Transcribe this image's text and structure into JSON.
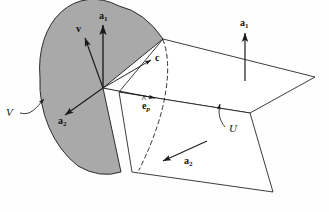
{
  "figure": {
    "kind": "vector-field-diagram",
    "caption": "",
    "colors": {
      "region_fill": "#a9a9a9",
      "stroke": "#1a1a1a",
      "background": "#fefefe",
      "dashed": "#1a1a1a"
    },
    "labels": {
      "region_v": "V",
      "vector_v": "v",
      "vector_a1_region": "a",
      "vector_a1_region_sub": "1",
      "vector_a2_region": "a",
      "vector_a2_region_sub": "2",
      "vector_c": "c",
      "vector_ep": "e",
      "vector_ep_hat": "^",
      "vector_ep_sub": "p",
      "vector_a1_plane": "a",
      "vector_a1_plane_sub": "1",
      "vector_a2_plane": "a",
      "vector_a2_plane_sub": "2",
      "surface_u": "U"
    },
    "geometry": {
      "origin": [
        103,
        88
      ],
      "region_note": "shaded ellipse with wedge notch removed at right",
      "planes": 2,
      "dashed_arc_note": "dashed curve marks intersection of region boundary with planes"
    }
  }
}
